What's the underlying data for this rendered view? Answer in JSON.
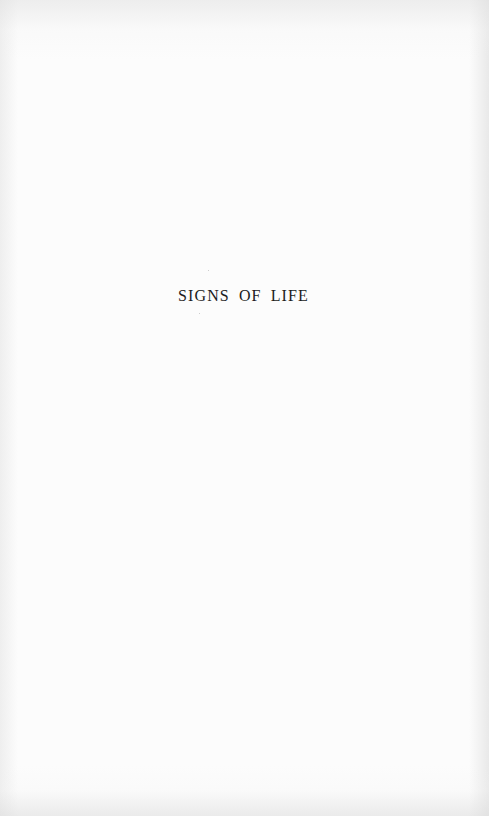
{
  "page": {
    "type": "half-title page",
    "title": "SIGNS OF LIFE",
    "background_color": "#fcfcfc",
    "text_color": "#1c1c1c"
  }
}
